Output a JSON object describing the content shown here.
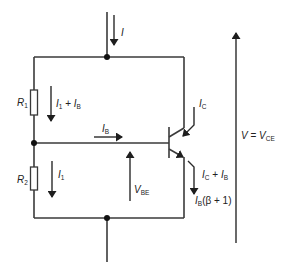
{
  "diagram": {
    "type": "transistor bias circuit (voltage divider with BJT)",
    "components": {
      "r1": {
        "label": "R",
        "sub": "1"
      },
      "r2": {
        "label": "R",
        "sub": "2"
      },
      "transistor": {
        "kind": "NPN BJT"
      }
    },
    "currents": {
      "supply": {
        "label": "I"
      },
      "r1_current": {
        "a": "I",
        "a_sub": "1",
        "op": " + ",
        "b": "I",
        "b_sub": "B"
      },
      "r2_current": {
        "a": "I",
        "a_sub": "1"
      },
      "base": {
        "a": "I",
        "a_sub": "B"
      },
      "collector": {
        "a": "I",
        "a_sub": "C"
      },
      "emitter_sum": {
        "a": "I",
        "a_sub": "C",
        "op": " + ",
        "b": "I",
        "b_sub": "B"
      },
      "emitter_beta": {
        "a": "I",
        "a_sub": "B",
        "rest": "(β + 1)"
      }
    },
    "voltages": {
      "vbe": {
        "a": "V",
        "a_sub": "BE"
      },
      "vce": {
        "a": "V",
        "eq": " = ",
        "b": "V",
        "b_sub": "CE"
      }
    },
    "colors": {
      "line": "#3a3a3a",
      "background": "#ffffff"
    }
  }
}
